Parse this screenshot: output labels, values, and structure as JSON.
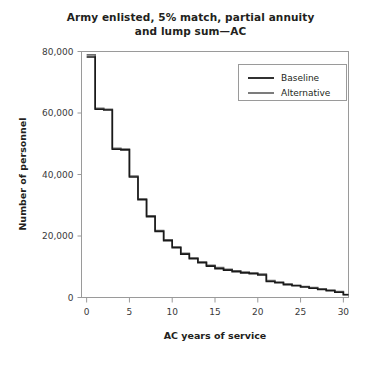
{
  "chart_data": {
    "type": "line",
    "title": "Army enlisted, 5% match, partial annuity and lump sum—AC",
    "title_line1": "Army enlisted, 5% match, partial annuity",
    "title_line2": "and lump sum—AC",
    "xlabel": "AC years of service",
    "ylabel": "Number of personnel",
    "xlim": [
      -0.6,
      30.6
    ],
    "ylim": [
      0,
      80000
    ],
    "xticks": [
      0,
      5,
      10,
      15,
      20,
      25,
      30
    ],
    "xtick_labels": [
      "0",
      "5",
      "10",
      "15",
      "20",
      "25",
      "30"
    ],
    "yticks": [
      0,
      20000,
      40000,
      60000,
      80000
    ],
    "ytick_labels": [
      "0",
      "20,000",
      "40,000",
      "60,000",
      "80,000"
    ],
    "grid": false,
    "step_style": "post",
    "legend_position": "top-right",
    "legend": [
      "Baseline",
      "Alternative"
    ],
    "x": [
      0,
      1,
      2,
      3,
      4,
      5,
      6,
      7,
      8,
      9,
      10,
      11,
      12,
      13,
      14,
      15,
      16,
      17,
      18,
      19,
      20,
      21,
      22,
      23,
      24,
      25,
      26,
      27,
      28,
      29,
      30
    ],
    "series": [
      {
        "name": "Baseline",
        "color": "#1a1a1a",
        "values": [
          78200,
          61200,
          61000,
          48200,
          48000,
          39200,
          31800,
          26300,
          21500,
          18500,
          16200,
          14100,
          12600,
          11300,
          10200,
          9400,
          8900,
          8400,
          8000,
          7700,
          7300,
          5200,
          4800,
          4200,
          3800,
          3400,
          3000,
          2600,
          2200,
          1700,
          900
        ]
      },
      {
        "name": "Alternative",
        "color": "#6e6e6e",
        "values": [
          78900,
          61500,
          61200,
          48500,
          48300,
          39500,
          32100,
          26600,
          21800,
          18800,
          16500,
          14400,
          12900,
          11600,
          10500,
          9700,
          9200,
          8700,
          8300,
          8000,
          7600,
          5500,
          5000,
          4400,
          4000,
          3600,
          3200,
          2800,
          2400,
          1900,
          1000
        ]
      }
    ]
  }
}
